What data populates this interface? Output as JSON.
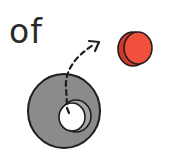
{
  "illustration": {
    "word": "of",
    "ring": {
      "fill": "#8c8a8a",
      "stroke": "#1e1e1e"
    },
    "hole": {
      "fill": "#ffffff"
    },
    "disc": {
      "fill": "#f0503c",
      "edge": "#d23a2a"
    },
    "arrow": {
      "style": "dashed",
      "color": "#1e1e1e"
    }
  }
}
